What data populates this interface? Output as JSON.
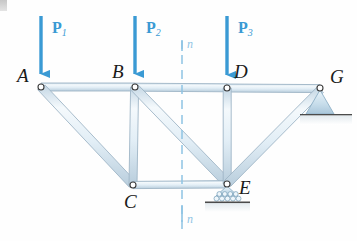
{
  "figure": {
    "background_color": "#fefefe",
    "member_fill": "#e8f1f8",
    "member_edge": "#9fb6c6",
    "load_color": "#3a9ad4",
    "section_color": "#8fc4e4",
    "label_color": "#1a1a1a",
    "support_fill": "#cfe2ee",
    "ground_color": "#555555"
  },
  "joints": [
    {
      "id": "A",
      "label": "A",
      "x": 41,
      "y": 87,
      "label_x": 17,
      "label_y": 66
    },
    {
      "id": "B",
      "label": "B",
      "x": 135,
      "y": 87,
      "label_x": 112,
      "label_y": 62
    },
    {
      "id": "D",
      "label": "D",
      "x": 227,
      "y": 88,
      "label_x": 234,
      "label_y": 62
    },
    {
      "id": "G",
      "label": "G",
      "x": 320,
      "y": 88,
      "label_x": 330,
      "label_y": 67
    },
    {
      "id": "C",
      "label": "C",
      "x": 133,
      "y": 185,
      "label_x": 124,
      "label_y": 192
    },
    {
      "id": "E",
      "label": "E",
      "x": 227,
      "y": 184,
      "label_x": 239,
      "label_y": 178
    }
  ],
  "members": [
    {
      "from": "A",
      "to": "B",
      "name": "top-chord-AB"
    },
    {
      "from": "B",
      "to": "D",
      "name": "top-chord-BD"
    },
    {
      "from": "D",
      "to": "G",
      "name": "top-chord-DG"
    },
    {
      "from": "A",
      "to": "C",
      "name": "diagonal-AC"
    },
    {
      "from": "B",
      "to": "C",
      "name": "vertical-BC"
    },
    {
      "from": "B",
      "to": "E",
      "name": "diagonal-BE"
    },
    {
      "from": "C",
      "to": "E",
      "name": "bottom-chord-CE"
    },
    {
      "from": "D",
      "to": "E",
      "name": "vertical-DE"
    },
    {
      "from": "E",
      "to": "G",
      "name": "diagonal-EG"
    }
  ],
  "loads": [
    {
      "id": "P1",
      "label": "P",
      "sub": "1",
      "x": 41,
      "tail_y": 16,
      "head_y": 84,
      "label_x": 52,
      "label_y": 20
    },
    {
      "id": "P2",
      "label": "P",
      "sub": "2",
      "x": 135,
      "tail_y": 16,
      "head_y": 84,
      "label_x": 146,
      "label_y": 20
    },
    {
      "id": "P3",
      "label": "P",
      "sub": "3",
      "x": 227,
      "tail_y": 16,
      "head_y": 85,
      "label_x": 238,
      "label_y": 20
    }
  ],
  "section_line": {
    "label": "n",
    "x": 182,
    "top_y": 40,
    "bottom_y": 230,
    "top_label_x": 187,
    "top_label_y": 38,
    "bottom_label_x": 187,
    "bottom_label_y": 213
  },
  "supports": [
    {
      "id": "G",
      "type": "pin",
      "joint": "G",
      "x": 320,
      "y": 88,
      "ground_y": 114,
      "half_width": 14,
      "ground_left": 300,
      "ground_right": 352
    },
    {
      "id": "E",
      "type": "roller",
      "joint": "E",
      "x": 227,
      "y": 184,
      "ground_y": 203,
      "half_width": 13,
      "ground_left": 203,
      "ground_right": 252,
      "roller_count": 7
    }
  ]
}
